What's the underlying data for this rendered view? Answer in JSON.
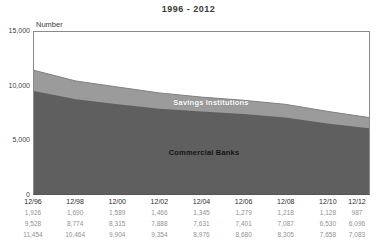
{
  "title": "1996 - 2012",
  "axis": {
    "unit_label": "Number",
    "y_ticks": [
      {
        "label": "15,000",
        "value": 15000
      },
      {
        "label": "10,000",
        "value": 10000
      },
      {
        "label": "5,000",
        "value": 5000
      },
      {
        "label": "0",
        "value": 0
      }
    ]
  },
  "chart_data": {
    "type": "area",
    "stacked": true,
    "title": "1996 - 2012",
    "ylabel": "Number",
    "ylim": [
      0,
      15000
    ],
    "grid": false,
    "legend_position": "labels-inside-areas",
    "x_labels": [
      "12/96",
      "12/98",
      "12/00",
      "12/02",
      "12/04",
      "12/06",
      "12/08",
      "12/10",
      "12/12"
    ],
    "series": [
      {
        "name": "Commercial Banks",
        "values": [
          9528,
          8774,
          8315,
          7888,
          7631,
          7401,
          7087,
          6530,
          6096
        ],
        "color": "#5f5f5f"
      },
      {
        "name": "Savings Institutions",
        "values": [
          1926,
          1690,
          1589,
          1466,
          1345,
          1279,
          1218,
          1128,
          987
        ],
        "color": "#9b9b9b"
      }
    ],
    "totals": [
      11454,
      10464,
      9904,
      9354,
      8976,
      8680,
      8305,
      7658,
      7083
    ],
    "total_edge_color": "#7f7f7f"
  },
  "table": {
    "rows": [
      {
        "name": "Savings Institutions",
        "values": [
          "1,926",
          "1,690",
          "1,589",
          "1,466",
          "1,345",
          "1,279",
          "1,218",
          "1,128",
          "987"
        ]
      },
      {
        "name": "Commercial Banks",
        "values": [
          "9,528",
          "8,774",
          "8,315",
          "7,888",
          "7,631",
          "7,401",
          "7,087",
          "6,530",
          "6,096"
        ]
      },
      {
        "name": "Total",
        "values": [
          "11,454",
          "10,464",
          "9,904",
          "9,354",
          "8,976",
          "8,680",
          "8,305",
          "7,658",
          "7,083"
        ]
      }
    ]
  }
}
